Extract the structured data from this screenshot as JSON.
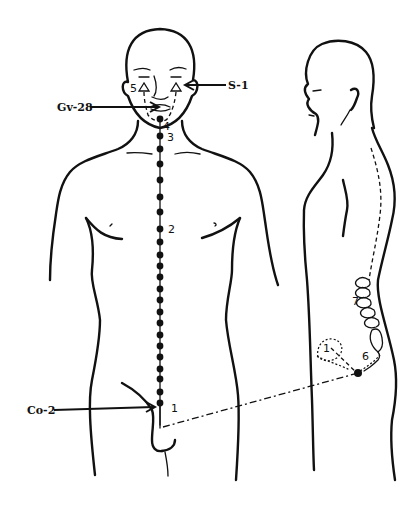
{
  "diagram": {
    "type": "acupuncture-meridian-illustration",
    "figures": [
      "front-view-body",
      "side-view-body"
    ],
    "labels": {
      "s1": "S-1",
      "gv28": "Gv-28",
      "co2": "Co-2"
    },
    "numbers": {
      "n1_front": "1",
      "n2": "2",
      "n3": "3",
      "n4": "4",
      "n5": "5",
      "n6": "6",
      "n7": "7",
      "n1_side": "1"
    },
    "colors": {
      "ink": "#111111",
      "background": "#ffffff"
    }
  }
}
